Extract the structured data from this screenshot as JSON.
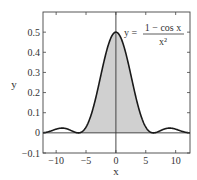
{
  "chart_data": {
    "type": "area",
    "title": "",
    "xlabel": "x",
    "ylabel": "y",
    "xlim": [
      -12.2,
      12.4
    ],
    "ylim": [
      -0.1,
      0.6
    ],
    "xticks": [
      -10,
      -5,
      0,
      5,
      10
    ],
    "xtick_labels": [
      "−10",
      "−5",
      "0",
      "5",
      "10"
    ],
    "yticks": [
      -0.1,
      0,
      0.1,
      0.2,
      0.3,
      0.4,
      0.5
    ],
    "ytick_labels": [
      "−0.1",
      "0",
      "0.1",
      "0.2",
      "0.3",
      "0.4",
      "0.5"
    ],
    "grid": false,
    "series": [
      {
        "name": "y = (1 − cos x) / x²",
        "function": "(1 - cos(x)) / x^2",
        "x": [
          -12,
          -10,
          -9,
          -8,
          -6.28,
          -5,
          -4,
          -3,
          -2,
          -1,
          0,
          1,
          2,
          3,
          4,
          5,
          6.28,
          8,
          9,
          10,
          12
        ],
        "values": [
          0.0011,
          0.0184,
          0.0236,
          0.0178,
          0.0,
          0.0287,
          0.1033,
          0.2211,
          0.354,
          0.4597,
          0.5,
          0.4597,
          0.354,
          0.2211,
          0.1033,
          0.0287,
          0.0,
          0.0178,
          0.0236,
          0.0184,
          0.0011
        ]
      }
    ],
    "shaded_region": {
      "from": -6.283,
      "to": 6.283,
      "color": "#cfcfcf"
    },
    "annotations": [
      {
        "text_lhs": "y =",
        "numerator": "1 − cos x",
        "denominator": "x²",
        "position": [
          1.5,
          0.5
        ]
      }
    ],
    "colors": {
      "curve": "#1a1a1a",
      "fill": "#d0d0d0",
      "axes": "#444444"
    }
  },
  "labels": {
    "xlabel": "x",
    "ylabel": "y",
    "eq_lhs": "y =",
    "eq_num": "1 − cos x",
    "eq_den": "x²"
  }
}
